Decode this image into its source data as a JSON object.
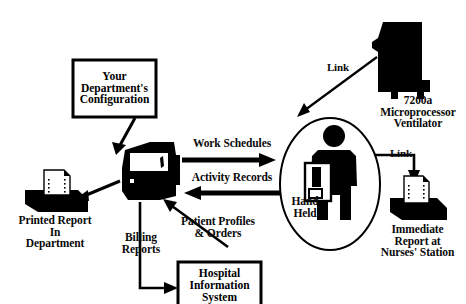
{
  "diagram": {
    "background_color": "#ffffff",
    "ink_color": "#000000",
    "type": "flow-diagram"
  },
  "boxes": [
    {
      "id": "department-configuration",
      "label": "Your\nDepartment's\nConfiguration",
      "shape": "rectangle"
    },
    {
      "id": "hospital-information-system",
      "label": "Hospital\nInformation\nSystem",
      "shape": "rectangle"
    }
  ],
  "nodes": [
    {
      "id": "workstation",
      "icon": "computer-workstation-icon",
      "label": ""
    },
    {
      "id": "printed-report",
      "icon": "printer-icon",
      "label": "Printed Report\nIn\nDepartment"
    },
    {
      "id": "hand-held",
      "icon": "person-with-handheld-icon",
      "label": "Hand\nHeld"
    },
    {
      "id": "ventilator",
      "icon": "ventilator-icon",
      "label": "7200a\nMicroprocessor\nVentilator"
    },
    {
      "id": "nurses-station-report",
      "icon": "printer-icon",
      "label": "Immediate\nReport at\nNurses' Station"
    }
  ],
  "flows": [
    {
      "id": "work-schedules",
      "label": "Work Schedules",
      "direction": "right"
    },
    {
      "id": "activity-records",
      "label": "Activity Records",
      "direction": "left"
    },
    {
      "id": "patient-profiles",
      "label": "Patient Profiles\n& Orders",
      "direction": "up-left"
    },
    {
      "id": "billing-reports",
      "label": "Billing\nReports",
      "direction": "down-right"
    },
    {
      "id": "link-ventilator",
      "label": "Link",
      "direction": "down-left"
    },
    {
      "id": "link-nurses",
      "label": "Link",
      "direction": "right-down"
    }
  ]
}
